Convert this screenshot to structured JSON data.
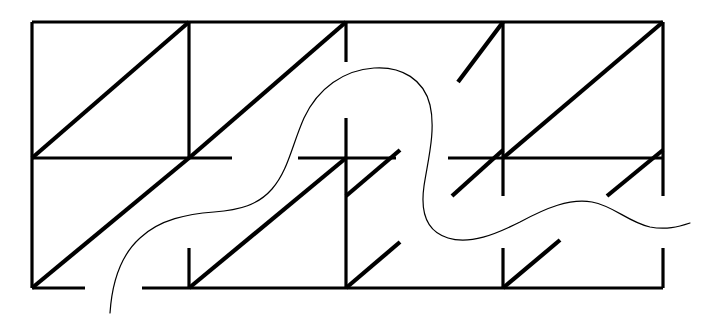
{
  "figure": {
    "canvas": {
      "width": 706,
      "height": 321,
      "background_color": "#ffffff"
    },
    "style": {
      "grid_color": "#000000",
      "diagonal_color": "#000000",
      "curve_color": "#000000",
      "grid_stroke_width": 3.2,
      "diagonal_stroke_width": 4.2,
      "curve_stroke_width": 1.2
    },
    "geometry": {
      "left": 32,
      "right": 663,
      "top": 22,
      "bottom": 288,
      "mid_y": 158,
      "columns_x": [
        32,
        189,
        346,
        503,
        663
      ],
      "rows_y": [
        22,
        158,
        288
      ]
    },
    "grid_segments": [
      {
        "name": "outer-top-edge",
        "x1": 32,
        "y1": 22,
        "x2": 663,
        "y2": 22
      },
      {
        "name": "outer-left-edge",
        "x1": 32,
        "y1": 22,
        "x2": 32,
        "y2": 288
      },
      {
        "name": "bottom-edge-left-part",
        "x1": 32,
        "y1": 288,
        "x2": 85,
        "y2": 288
      },
      {
        "name": "bottom-edge-right-part",
        "x1": 142,
        "y1": 288,
        "x2": 663,
        "y2": 288
      },
      {
        "name": "right-edge-upper",
        "x1": 663,
        "y1": 22,
        "x2": 663,
        "y2": 158
      },
      {
        "name": "right-edge-upper-tail",
        "x1": 663,
        "y1": 158,
        "x2": 663,
        "y2": 196
      },
      {
        "name": "right-edge-lower",
        "x1": 663,
        "y1": 248,
        "x2": 663,
        "y2": 288
      },
      {
        "name": "mid-horizontal-seg-1",
        "x1": 32,
        "y1": 158,
        "x2": 232,
        "y2": 158
      },
      {
        "name": "mid-horizontal-seg-2",
        "x1": 298,
        "y1": 158,
        "x2": 396,
        "y2": 158
      },
      {
        "name": "mid-horizontal-seg-3",
        "x1": 448,
        "y1": 158,
        "x2": 663,
        "y2": 158
      },
      {
        "name": "vertical-1-upper",
        "x1": 189,
        "y1": 22,
        "x2": 189,
        "y2": 158
      },
      {
        "name": "vertical-1-lower-stub",
        "x1": 189,
        "y1": 248,
        "x2": 189,
        "y2": 288
      },
      {
        "name": "vertical-2-upper-stub",
        "x1": 346,
        "y1": 22,
        "x2": 346,
        "y2": 62
      },
      {
        "name": "vertical-2-mid",
        "x1": 346,
        "y1": 118,
        "x2": 346,
        "y2": 196
      },
      {
        "name": "vertical-2-lower",
        "x1": 346,
        "y1": 196,
        "x2": 346,
        "y2": 288
      },
      {
        "name": "vertical-3-upper",
        "x1": 503,
        "y1": 22,
        "x2": 503,
        "y2": 158
      },
      {
        "name": "vertical-3-stub-below-mid",
        "x1": 503,
        "y1": 158,
        "x2": 503,
        "y2": 196
      },
      {
        "name": "vertical-3-lower-stub",
        "x1": 503,
        "y1": 248,
        "x2": 503,
        "y2": 288
      }
    ],
    "diagonals": [
      {
        "name": "diagonal-r1c1-full",
        "x1": 32,
        "y1": 158,
        "x2": 189,
        "y2": 22
      },
      {
        "name": "diagonal-r1c2-full",
        "x1": 189,
        "y1": 158,
        "x2": 346,
        "y2": 22
      },
      {
        "name": "diagonal-r1c3-partial",
        "x1": 458,
        "y1": 82,
        "x2": 503,
        "y2": 22
      },
      {
        "name": "diagonal-r1c4-full",
        "x1": 503,
        "y1": 158,
        "x2": 663,
        "y2": 22
      },
      {
        "name": "diagonal-r2c1-full",
        "x1": 32,
        "y1": 288,
        "x2": 189,
        "y2": 158
      },
      {
        "name": "diagonal-r2c2-full",
        "x1": 189,
        "y1": 288,
        "x2": 346,
        "y2": 158
      },
      {
        "name": "diagonal-r2c3-upper-stub",
        "x1": 346,
        "y1": 196,
        "x2": 400,
        "y2": 150
      },
      {
        "name": "diagonal-r2c3-lower-stub",
        "x1": 346,
        "y1": 288,
        "x2": 400,
        "y2": 242
      },
      {
        "name": "diagonal-r2c4-upper-stub",
        "x1": 452,
        "y1": 196,
        "x2": 503,
        "y2": 150
      },
      {
        "name": "diagonal-r2c4-stub-right",
        "x1": 607,
        "y1": 196,
        "x2": 663,
        "y2": 150
      },
      {
        "name": "diagonal-r2c4-lower-stub",
        "x1": 503,
        "y1": 288,
        "x2": 560,
        "y2": 240
      }
    ],
    "curve": {
      "name": "overlay-freeform-curve",
      "path": "M 110 313 C 112 283 120 256 140 238 C 160 219 188 214 214 212 C 240 210 258 205 272 189 C 288 171 292 145 304 118 C 318 88 344 70 374 68 C 402 66 424 80 430 105 C 436 130 428 160 424 186 C 420 214 428 232 448 238 C 470 245 496 234 520 222 C 546 208 570 198 592 202 C 614 206 628 222 650 227 C 666 230 678 227 690 223",
      "start_point": [
        110,
        313
      ],
      "end_point": [
        690,
        223
      ]
    }
  }
}
